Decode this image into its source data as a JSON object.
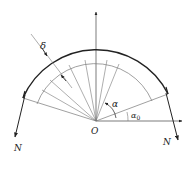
{
  "diagram": {
    "labels": {
      "delta": "δ",
      "alpha": "α",
      "alpha0": "α",
      "alpha0_sub": "0",
      "origin": "O",
      "force_left": "N",
      "force_right": "N"
    },
    "colors": {
      "stroke": "#222222",
      "thin": "#777777"
    }
  }
}
